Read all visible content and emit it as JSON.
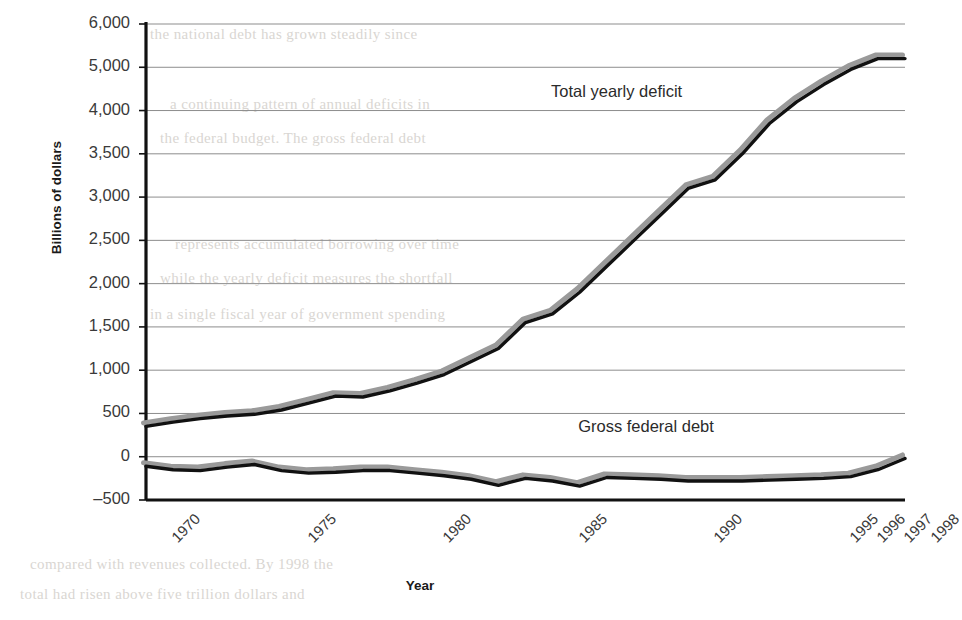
{
  "chart_data": {
    "type": "line",
    "title": "",
    "xlabel": "Year",
    "ylabel": "Billions of dollars",
    "grid": true,
    "legend_position": "in-plot-annotation",
    "x_tick_labels": [
      "1970",
      "1975",
      "1980",
      "1985",
      "1990",
      "1995",
      "1996",
      "1997",
      "1998"
    ],
    "x_tick_years": [
      1970,
      1975,
      1980,
      1985,
      1990,
      1995,
      1996,
      1997,
      1998
    ],
    "xlim": [
      1970,
      1998
    ],
    "y_tick_labels": [
      "6,000",
      "5,000",
      "4,000",
      "3,500",
      "3,000",
      "2,500",
      "2,000",
      "1,500",
      "1,000",
      "500",
      "0",
      "-500"
    ],
    "y_tick_values": [
      6000,
      5000,
      4000,
      3500,
      3000,
      2500,
      2000,
      1500,
      1000,
      500,
      0,
      -500
    ],
    "y_axis_note": "gridlines evenly spaced although value gap 4,000 to 5,000 skips 4,500",
    "ylim": [
      -500,
      6000
    ],
    "series": [
      {
        "name": "Total yearly deficit",
        "label_position": "upper",
        "color": "#111111",
        "shadow_color": "#9a9a9a",
        "x": [
          1970,
          1971,
          1972,
          1973,
          1974,
          1975,
          1976,
          1977,
          1978,
          1979,
          1980,
          1981,
          1982,
          1983,
          1984,
          1985,
          1986,
          1987,
          1988,
          1989,
          1990,
          1991,
          1992,
          1993,
          1994,
          1995,
          1996,
          1997,
          1998
        ],
        "values": [
          350,
          400,
          440,
          470,
          490,
          540,
          620,
          700,
          690,
          760,
          850,
          950,
          1100,
          1250,
          1550,
          1650,
          1900,
          2200,
          2500,
          2800,
          3100,
          3200,
          3500,
          3850,
          4200,
          4600,
          4950,
          5200,
          5200
        ]
      },
      {
        "name": "Gross federal debt",
        "label_position": "lower",
        "color": "#111111",
        "shadow_color": "#9a9a9a",
        "x": [
          1970,
          1971,
          1972,
          1973,
          1974,
          1975,
          1976,
          1977,
          1978,
          1979,
          1980,
          1981,
          1982,
          1983,
          1984,
          1985,
          1986,
          1987,
          1988,
          1989,
          1990,
          1991,
          1992,
          1993,
          1994,
          1995,
          1996,
          1997,
          1998
        ],
        "values": [
          -110,
          -150,
          -160,
          -120,
          -90,
          -160,
          -190,
          -180,
          -160,
          -160,
          -190,
          -220,
          -260,
          -330,
          -250,
          -280,
          -340,
          -240,
          -250,
          -260,
          -280,
          -280,
          -280,
          -270,
          -260,
          -250,
          -230,
          -150,
          -20
        ]
      }
    ],
    "annotations": [
      {
        "text": "Total yearly deficit",
        "x": 1989,
        "y": 4400
      },
      {
        "text": "Gross federal debt",
        "x": 1990,
        "y": 330
      }
    ]
  },
  "background_bleed": [
    "the national debt has grown steadily since",
    "a continuing pattern of annual deficits in",
    "the federal budget. The gross federal debt",
    "represents accumulated borrowing over time",
    "while the yearly deficit measures the shortfall",
    "in a single fiscal year of government spending",
    "compared with revenues collected. By 1998 the",
    "total had risen above five trillion dollars and"
  ]
}
